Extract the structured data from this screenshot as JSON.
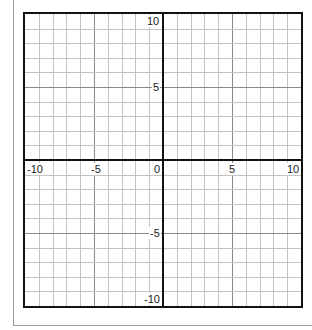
{
  "chart_data": {
    "type": "table",
    "title": "",
    "xlabel": "",
    "ylabel": "",
    "xlim": [
      -10,
      10
    ],
    "ylim": [
      -10,
      10
    ],
    "grid": true,
    "grid_step": 1,
    "major_step": 5,
    "x_tick_labels": [
      "-10",
      "-5",
      "0",
      "5",
      "10"
    ],
    "y_tick_labels": [
      "10",
      "5",
      "-5",
      "-10"
    ],
    "series": [],
    "legend": null
  },
  "labels": {
    "x": {
      "neg10": "-10",
      "neg5": "-5",
      "zero": "0",
      "pos5": "5",
      "pos10": "10"
    },
    "y": {
      "pos10": "10",
      "pos5": "5",
      "neg5": "-5",
      "neg10": "-10"
    }
  },
  "colors": {
    "axis": "#111111",
    "grid_minor": "#c4c4c4",
    "grid_major": "#8a8a8a",
    "background": "#ffffff"
  }
}
